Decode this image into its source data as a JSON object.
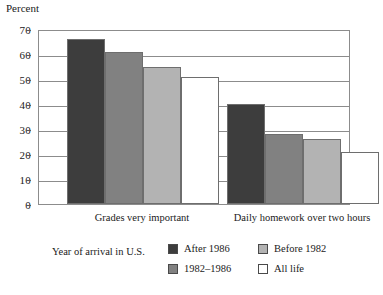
{
  "chart_data": {
    "type": "bar",
    "title": "",
    "ylabel": "Percent",
    "xlabel": "",
    "ylim": [
      0,
      70
    ],
    "yticks": [
      0,
      10,
      20,
      30,
      40,
      50,
      60,
      70
    ],
    "grid": true,
    "legend_position": "bottom",
    "legend_title": "Year of arrival in U.S.",
    "categories": [
      "Grades very important",
      "Daily homework over two hours"
    ],
    "series": [
      {
        "name": "After 1986",
        "color": "#3d3d3d",
        "values": [
          66,
          40
        ]
      },
      {
        "name": "1982–1986",
        "color": "#818181",
        "values": [
          61,
          28
        ]
      },
      {
        "name": "Before 1982",
        "color": "#b3b3b3",
        "values": [
          55,
          26
        ]
      },
      {
        "name": "All life",
        "color": "#ffffff",
        "values": [
          51,
          21
        ]
      }
    ]
  },
  "axis": {
    "y_title": "Percent",
    "tick_labels": [
      "70",
      "60",
      "50",
      "40",
      "30",
      "20",
      "10",
      "0"
    ]
  },
  "legend": {
    "title": "Year of arrival in U.S.",
    "entries": [
      {
        "label": "After 1986"
      },
      {
        "label": "1982–1986"
      },
      {
        "label": "Before 1982"
      },
      {
        "label": "All life"
      }
    ]
  }
}
